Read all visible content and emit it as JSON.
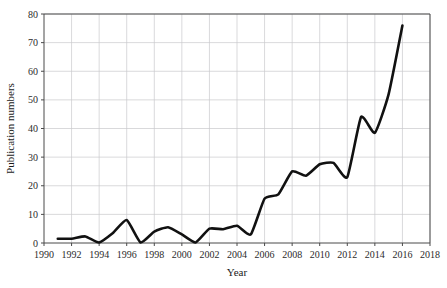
{
  "chart_data": {
    "type": "line",
    "title": "",
    "xlabel": "Year",
    "ylabel": "Publication numbers",
    "xlim": [
      1990,
      2018
    ],
    "ylim": [
      0,
      80
    ],
    "xticks": [
      1990,
      1992,
      1994,
      1996,
      1998,
      2000,
      2002,
      2004,
      2006,
      2008,
      2010,
      2012,
      2014,
      2016,
      2018
    ],
    "yticks": [
      0,
      10,
      20,
      30,
      40,
      50,
      60,
      70,
      80
    ],
    "xtick_labels": [
      "1990",
      "1992",
      "1994",
      "1996",
      "1998",
      "2000",
      "2002",
      "2004",
      "2006",
      "2008",
      "2010",
      "2012",
      "2014",
      "2016",
      "2018"
    ],
    "ytick_labels": [
      "0",
      "10",
      "20",
      "30",
      "40",
      "50",
      "60",
      "70",
      "80"
    ],
    "grid": true,
    "legend": "none",
    "smoothing": "spline",
    "line_color": "#111111",
    "grid_color": "#c8c8cc",
    "axis_color": "#4a4a4a",
    "x": [
      1991,
      1992,
      1993,
      1994,
      1995,
      1996,
      1997,
      1998,
      1999,
      2000,
      2001,
      2002,
      2003,
      2004,
      2005,
      2006,
      2007,
      2008,
      2009,
      2010,
      2011,
      2012,
      2013,
      2014,
      2015,
      2016
    ],
    "values": [
      1.5,
      1.5,
      2.3,
      0.2,
      3.5,
      8.0,
      0.2,
      4.0,
      5.5,
      3.0,
      0.2,
      5.0,
      4.8,
      6.0,
      3.0,
      15.5,
      17.0,
      25.0,
      23.5,
      27.5,
      28.0,
      23.0,
      44.0,
      38.5,
      52.0,
      76.0
    ],
    "series": [
      {
        "name": "Publication numbers",
        "values": [
          1.5,
          1.5,
          2.3,
          0.2,
          3.5,
          8.0,
          0.2,
          4.0,
          5.5,
          3.0,
          0.2,
          5.0,
          4.8,
          6.0,
          3.0,
          15.5,
          17.0,
          25.0,
          23.5,
          27.5,
          28.0,
          23.0,
          44.0,
          38.5,
          52.0,
          76.0
        ]
      }
    ]
  },
  "labels": {
    "x_axis_title": "Year",
    "y_axis_title": "Publication numbers"
  }
}
